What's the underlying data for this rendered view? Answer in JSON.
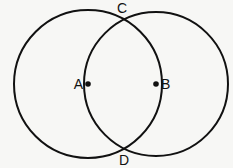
{
  "diagram": {
    "type": "geometry-figure",
    "background_color": "#f7f7f5",
    "stroke_color": "#111111",
    "stroke_width": 2,
    "canvas": {
      "width": 233,
      "height": 168
    },
    "circles": [
      {
        "id": "left-circle",
        "center_label": "A",
        "cx": 88,
        "cy": 84,
        "r": 74
      },
      {
        "id": "right-circle",
        "center_label": "B",
        "cx": 156,
        "cy": 84,
        "r": 72
      }
    ],
    "points": [
      {
        "id": "point-a",
        "label": "A",
        "role": "center-of-left-circle",
        "x": 88,
        "y": 84,
        "has_dot": true,
        "dot_radius": 2.8,
        "label_x": 83,
        "label_y": 89,
        "label_anchor": "end"
      },
      {
        "id": "point-b",
        "label": "B",
        "role": "center-of-right-circle",
        "x": 156,
        "y": 84,
        "has_dot": true,
        "dot_radius": 2.8,
        "label_x": 161,
        "label_y": 89,
        "label_anchor": "start"
      },
      {
        "id": "point-c",
        "label": "C",
        "role": "upper-intersection",
        "x": 124,
        "y": 20,
        "has_dot": false,
        "dot_radius": 0,
        "label_x": 122,
        "label_y": 13,
        "label_anchor": "middle"
      },
      {
        "id": "point-d",
        "label": "D",
        "role": "lower-intersection",
        "x": 124,
        "y": 148,
        "has_dot": false,
        "dot_radius": 0,
        "label_x": 124,
        "label_y": 165,
        "label_anchor": "middle"
      }
    ]
  }
}
